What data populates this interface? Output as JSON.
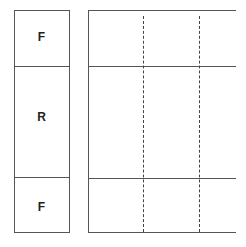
{
  "diagram": {
    "left_column": {
      "cells": [
        {
          "label": "F"
        },
        {
          "label": "R"
        },
        {
          "label": "F"
        }
      ]
    },
    "right_grid": {
      "rows": 3,
      "dashed_columns": 2
    },
    "colors": {
      "line": "#555555",
      "background": "#ffffff",
      "text": "#222222"
    }
  }
}
